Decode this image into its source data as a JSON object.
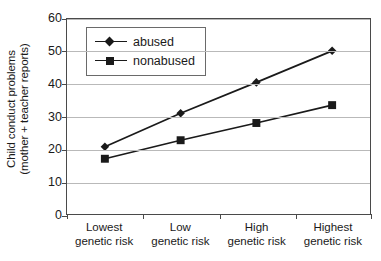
{
  "chart_data": {
    "type": "line",
    "title": "",
    "xlabel": "",
    "ylabel": "Child conduct problems (mother + teacher reports)",
    "ylabel_line1": "Child conduct problems",
    "ylabel_line2": "(mother + teacher reports)",
    "categories": [
      "Lowest genetic risk",
      "Low genetic risk",
      "High genetic risk",
      "Highest genetic risk"
    ],
    "category_lines": [
      [
        "Lowest",
        "genetic risk"
      ],
      [
        "Low",
        "genetic risk"
      ],
      [
        "High",
        "genetic risk"
      ],
      [
        "Highest",
        "genetic risk"
      ]
    ],
    "series": [
      {
        "name": "abused",
        "marker": "diamond",
        "color": "#1a1a1a",
        "values": [
          20.7,
          31.0,
          40.5,
          50.2
        ]
      },
      {
        "name": "nonabused",
        "marker": "square",
        "color": "#1a1a1a",
        "values": [
          17.0,
          22.7,
          28.0,
          33.5
        ]
      }
    ],
    "ylim": [
      0,
      60
    ],
    "yticks": [
      0,
      10,
      20,
      30,
      40,
      50,
      60
    ],
    "ytick_labels": [
      "0",
      "10",
      "20",
      "30",
      "40",
      "50",
      "60"
    ],
    "grid": true,
    "legend_position": "top-left",
    "legend_entries": [
      "abused",
      "nonabused"
    ]
  }
}
